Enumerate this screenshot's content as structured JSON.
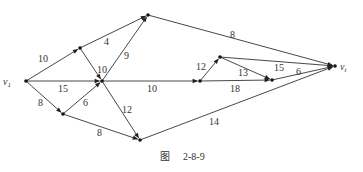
{
  "caption": {
    "prefix": "图",
    "number": "2-8-9"
  },
  "nodes": [
    {
      "id": "v1",
      "label": "v1",
      "x": 26,
      "y": 81
    },
    {
      "id": "A",
      "label": "",
      "x": 80,
      "y": 48
    },
    {
      "id": "B",
      "label": "",
      "x": 148,
      "y": 15
    },
    {
      "id": "C",
      "label": "",
      "x": 102,
      "y": 81
    },
    {
      "id": "D",
      "label": "",
      "x": 63,
      "y": 114
    },
    {
      "id": "E",
      "label": "",
      "x": 140,
      "y": 140
    },
    {
      "id": "F",
      "label": "",
      "x": 200,
      "y": 81
    },
    {
      "id": "G",
      "label": "",
      "x": 220,
      "y": 57
    },
    {
      "id": "H",
      "label": "",
      "x": 272,
      "y": 80
    },
    {
      "id": "vt",
      "label": "vt",
      "x": 335,
      "y": 66
    }
  ],
  "edges": [
    {
      "from": "v1",
      "to": "A",
      "weight": "10",
      "lx": 38,
      "ly": 62
    },
    {
      "from": "A",
      "to": "B",
      "weight": "4",
      "lx": 104,
      "ly": 45
    },
    {
      "from": "v1",
      "to": "C",
      "weight": "15",
      "lx": 58,
      "ly": 92
    },
    {
      "from": "A",
      "to": "C",
      "weight": "10",
      "lx": 97,
      "ly": 73
    },
    {
      "from": "C",
      "to": "B",
      "weight": "9",
      "lx": 124,
      "ly": 59
    },
    {
      "from": "v1",
      "to": "D",
      "weight": "8",
      "lx": 38,
      "ly": 106
    },
    {
      "from": "D",
      "to": "C",
      "weight": "6",
      "lx": 83,
      "ly": 106
    },
    {
      "from": "C",
      "to": "E",
      "weight": "12",
      "lx": 122,
      "ly": 113
    },
    {
      "from": "D",
      "to": "E",
      "weight": "8",
      "lx": 97,
      "ly": 136
    },
    {
      "from": "C",
      "to": "F",
      "weight": "10",
      "lx": 147,
      "ly": 92
    },
    {
      "from": "F",
      "to": "G",
      "weight": "12",
      "lx": 196,
      "ly": 70
    },
    {
      "from": "G",
      "to": "H",
      "weight": "13",
      "lx": 238,
      "ly": 76
    },
    {
      "from": "F",
      "to": "H",
      "weight": "18",
      "lx": 230,
      "ly": 92
    },
    {
      "from": "G",
      "to": "vt",
      "weight": "15",
      "lx": 274,
      "ly": 71
    },
    {
      "from": "H",
      "to": "vt",
      "weight": "6",
      "lx": 296,
      "ly": 75
    },
    {
      "from": "B",
      "to": "vt",
      "weight": "8",
      "lx": 230,
      "ly": 38
    },
    {
      "from": "E",
      "to": "vt",
      "weight": "14",
      "lx": 209,
      "ly": 125
    }
  ]
}
